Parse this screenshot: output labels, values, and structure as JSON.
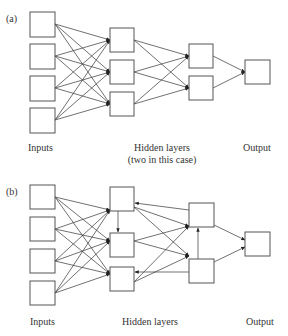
{
  "diagram": {
    "type": "neural-network-architectures",
    "panels": [
      {
        "id": "a",
        "tag": "(a)",
        "kind": "feedforward",
        "layers": [
          {
            "name": "Inputs",
            "count": 4
          },
          {
            "name": "Hidden layer 1",
            "count": 3
          },
          {
            "name": "Hidden layer 2",
            "count": 2
          },
          {
            "name": "Output",
            "count": 1
          }
        ],
        "labels": {
          "inputs": "Inputs",
          "hidden": "Hidden layers",
          "hidden_note": "(two in this case)",
          "output": "Output"
        }
      },
      {
        "id": "b",
        "tag": "(b)",
        "kind": "recurrent",
        "layers": [
          {
            "name": "Inputs",
            "count": 4
          },
          {
            "name": "Hidden layer 1",
            "count": 3
          },
          {
            "name": "Hidden layer 2",
            "count": 2
          },
          {
            "name": "Output",
            "count": 1
          }
        ],
        "extra_connections": [
          "hidden1[0] -> hidden1[1]",
          "hidden2[0] -> hidden1[0]",
          "hidden2[1] -> hidden1[2]",
          "hidden2[1] -> hidden2[0]"
        ],
        "labels": {
          "inputs": "Inputs",
          "hidden": "Hidden layers",
          "output": "Output"
        }
      }
    ]
  }
}
